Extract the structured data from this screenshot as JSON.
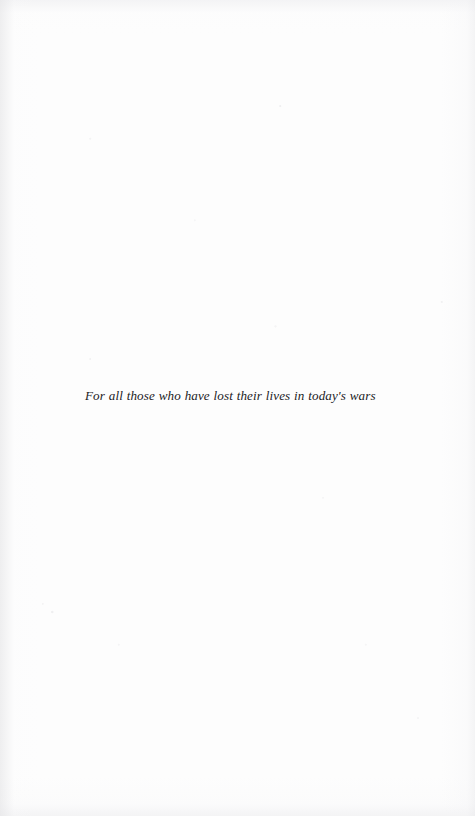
{
  "page": {
    "kind": "book-dedication-page",
    "background_color": "#fdfdfd",
    "text_color": "#1b1b1d"
  },
  "dedication": {
    "text": "For all those who have lost their lives in today's wars"
  }
}
